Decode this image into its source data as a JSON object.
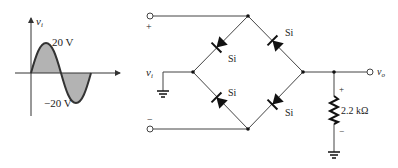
{
  "waveform": {
    "axis_label": "v",
    "axis_label_sub": "i",
    "peak_label": "20 V",
    "trough_label": "−20 V",
    "fill_color": "#b3b3b3",
    "stroke_color": "#333333"
  },
  "circuit": {
    "input_label": "v",
    "input_label_sub": "i",
    "plus_terminal": "+",
    "minus_terminal": "−",
    "output_label": "v",
    "output_label_sub": "o",
    "diodes": [
      {
        "position": "top-left",
        "material": "Si"
      },
      {
        "position": "top-right",
        "material": "Si"
      },
      {
        "position": "bottom-left",
        "material": "Si"
      },
      {
        "position": "bottom-right",
        "material": "Si"
      }
    ],
    "resistor": {
      "value": "2.2 kΩ",
      "plus": "+",
      "minus": "−"
    }
  }
}
